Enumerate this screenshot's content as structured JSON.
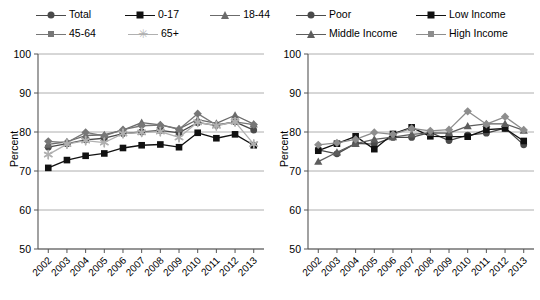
{
  "figure": {
    "yaxis_title": "Percent"
  },
  "panels": [
    {
      "name": "age-groups",
      "legend": [
        {
          "label": "Total",
          "marker": "circle",
          "color": "#4a4a4a"
        },
        {
          "label": "0-17",
          "marker": "square",
          "color": "#111111"
        },
        {
          "label": "18-44",
          "marker": "triangle",
          "color": "#6b6b6b"
        },
        {
          "label": "45-64",
          "marker": "diamond",
          "color": "#777777"
        },
        {
          "label": "65+",
          "marker": "star",
          "color": "#b0b0b0"
        }
      ]
    },
    {
      "name": "income-groups",
      "legend": [
        {
          "label": "Poor",
          "marker": "circle",
          "color": "#4a4a4a"
        },
        {
          "label": "Low Income",
          "marker": "square",
          "color": "#111111"
        },
        {
          "label": "Middle Income",
          "marker": "triangle",
          "color": "#5d5d5d"
        },
        {
          "label": "High Income",
          "marker": "diamond",
          "color": "#8d8d8d"
        }
      ]
    }
  ],
  "chart_data": [
    {
      "type": "line",
      "name": "age-groups",
      "title": "",
      "xlabel": "",
      "ylabel": "Percent",
      "grid": true,
      "legend_position": "top",
      "ylim": [
        50,
        100
      ],
      "yticks": [
        50,
        60,
        70,
        80,
        90,
        100
      ],
      "categories": [
        "2002",
        "2003",
        "2004",
        "2005",
        "2006",
        "2007",
        "2008",
        "2009",
        "2010",
        "2011",
        "2012",
        "2013"
      ],
      "series": [
        {
          "name": "Total",
          "marker": "circle",
          "color": "#4a4a4a",
          "values": [
            76.1,
            77.0,
            78.0,
            78.4,
            79.6,
            80.0,
            80.4,
            79.8,
            82.4,
            81.7,
            82.6,
            80.5
          ]
        },
        {
          "name": "0-17",
          "marker": "square",
          "color": "#111111",
          "values": [
            70.8,
            72.8,
            73.9,
            74.5,
            75.9,
            76.6,
            76.8,
            76.1,
            79.8,
            78.4,
            79.4,
            76.6
          ]
        },
        {
          "name": "18-44",
          "marker": "triangle",
          "color": "#6b6b6b",
          "values": [
            76.8,
            77.5,
            79.1,
            79.3,
            80.5,
            82.4,
            81.8,
            80.8,
            83.2,
            82.2,
            84.3,
            82.0
          ]
        },
        {
          "name": "45-64",
          "marker": "diamond",
          "color": "#777777",
          "values": [
            77.6,
            77.3,
            79.9,
            79.0,
            80.6,
            81.6,
            81.8,
            80.7,
            84.7,
            81.8,
            82.6,
            81.9
          ]
        },
        {
          "name": "65+",
          "marker": "star",
          "color": "#b0b0b0",
          "values": [
            74.2,
            76.9,
            77.8,
            77.3,
            79.6,
            79.9,
            80.1,
            78.6,
            82.5,
            81.6,
            82.6,
            76.9
          ]
        }
      ]
    },
    {
      "type": "line",
      "name": "income-groups",
      "title": "",
      "xlabel": "",
      "ylabel": "Percent",
      "grid": true,
      "legend_position": "top",
      "ylim": [
        50,
        100
      ],
      "yticks": [
        50,
        60,
        70,
        80,
        90,
        100
      ],
      "categories": [
        "2002",
        "2003",
        "2004",
        "2005",
        "2006",
        "2007",
        "2008",
        "2009",
        "2010",
        "2011",
        "2012",
        "2013"
      ],
      "series": [
        {
          "name": "Poor",
          "marker": "circle",
          "color": "#4a4a4a",
          "values": [
            75.4,
            74.4,
            77.1,
            76.9,
            78.6,
            78.6,
            79.9,
            77.8,
            79.2,
            79.7,
            81.0,
            76.7
          ]
        },
        {
          "name": "Low Income",
          "marker": "square",
          "color": "#111111",
          "values": [
            75.2,
            77.0,
            78.9,
            75.6,
            79.5,
            81.2,
            78.9,
            78.8,
            78.8,
            80.6,
            80.9,
            77.7
          ]
        },
        {
          "name": "Middle Income",
          "marker": "triangle",
          "color": "#5d5d5d",
          "values": [
            72.4,
            74.8,
            77.0,
            78.1,
            78.7,
            79.4,
            79.8,
            79.7,
            81.5,
            82.1,
            82.1,
            80.4
          ]
        },
        {
          "name": "High Income",
          "marker": "diamond",
          "color": "#8d8d8d",
          "values": [
            76.7,
            77.2,
            78.1,
            79.9,
            79.4,
            80.9,
            80.3,
            80.6,
            85.3,
            82.0,
            83.9,
            80.5
          ]
        }
      ]
    }
  ]
}
